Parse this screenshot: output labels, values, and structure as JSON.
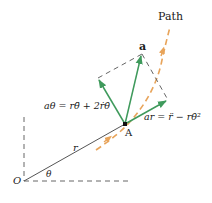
{
  "diagram": {
    "type": "kinematics-polar-acceleration",
    "colors": {
      "vector": "#3f9a5c",
      "path": "#e8a45a",
      "line": "#555555",
      "dashed": "#666666",
      "text": "#1a1a1a"
    },
    "labels": {
      "path": "Path",
      "accel_vector": "a",
      "point": "A",
      "origin": "O",
      "radius": "r",
      "angle": "θ",
      "a_theta": "aθ = rθ̈ + 2ṙθ̇",
      "a_r": "ar = r̈ − rθ̇²"
    },
    "points": {
      "origin": [
        24,
        181
      ],
      "A": [
        125,
        124
      ],
      "a_tip": [
        142,
        54
      ],
      "a_theta_tip": [
        98,
        78
      ],
      "a_r_tip": [
        168,
        100
      ]
    }
  }
}
